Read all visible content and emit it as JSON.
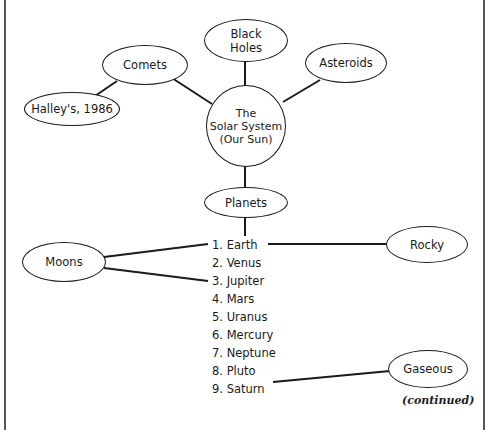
{
  "diagram": {
    "type": "concept-map",
    "center": {
      "label": "The\nSolar System\n(Our Sun)"
    },
    "nodes": {
      "comets": "Comets",
      "halleys": "Halley's, 1986",
      "black_holes": "Black\nHoles",
      "asteroids": "Asteroids",
      "planets": "Planets",
      "moons": "Moons",
      "rocky": "Rocky",
      "gaseous": "Gaseous"
    },
    "planet_list": [
      "1. Earth",
      "2. Venus",
      "3. Jupiter",
      "4. Mars",
      "5. Uranus",
      "6. Mercury",
      "7. Neptune",
      "8. Pluto",
      "9. Saturn"
    ],
    "edges": [
      [
        "The Solar System",
        "Comets"
      ],
      [
        "Comets",
        "Halley's, 1986"
      ],
      [
        "The Solar System",
        "Black Holes"
      ],
      [
        "The Solar System",
        "Asteroids"
      ],
      [
        "The Solar System",
        "Planets"
      ],
      [
        "Planets",
        "1. Earth"
      ],
      [
        "Moons",
        "1. Earth"
      ],
      [
        "Moons",
        "3. Jupiter"
      ],
      [
        "1. Earth",
        "Rocky"
      ],
      [
        "9. Saturn",
        "Gaseous"
      ]
    ],
    "footer_note": "(continued)"
  }
}
